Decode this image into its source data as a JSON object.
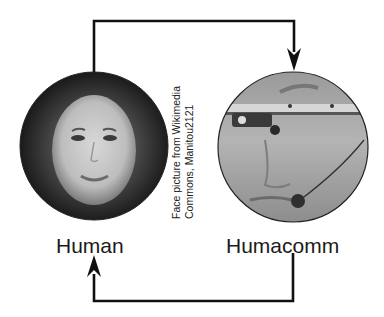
{
  "diagram": {
    "nodes": [
      {
        "id": "human",
        "label": "Human",
        "image": "face-photo-woman"
      },
      {
        "id": "humacomm",
        "label": "Humacomm",
        "image": "face-photo-with-head-mounted-device"
      }
    ],
    "edges": [
      {
        "from": "human",
        "to": "humacomm",
        "route": "top"
      },
      {
        "from": "humacomm",
        "to": "human",
        "route": "bottom"
      }
    ],
    "caption": {
      "line1": "Face picture from Wikimedia",
      "line2": "Commons, Manitou2121"
    },
    "colors": {
      "line": "#111111",
      "background": "#ffffff",
      "circle_outline": "#333333"
    }
  }
}
